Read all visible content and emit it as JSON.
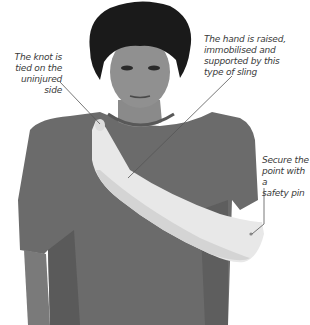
{
  "image": {
    "subject": "Woman wearing a triangular arm sling (first aid illustration)",
    "palette": {
      "background": "#ffffff",
      "shirt": "#6b6b6b",
      "shirt_shadow": "#555555",
      "skin": "#8a8a8a",
      "hair": "#1a1a1a",
      "sling": "#e8e8e8",
      "sling_shadow": "#cfcfcf",
      "leader_line": "#555555",
      "label_text": "#3a3a3a"
    }
  },
  "annotations": {
    "knot": {
      "text": "The knot is\ntied on the\nuninjured side"
    },
    "hand": {
      "text": "The hand is raised,\nimmobilised and\nsupported by this\ntype of sling"
    },
    "pin": {
      "text": "Secure the\npoint with a\nsafety pin"
    }
  }
}
